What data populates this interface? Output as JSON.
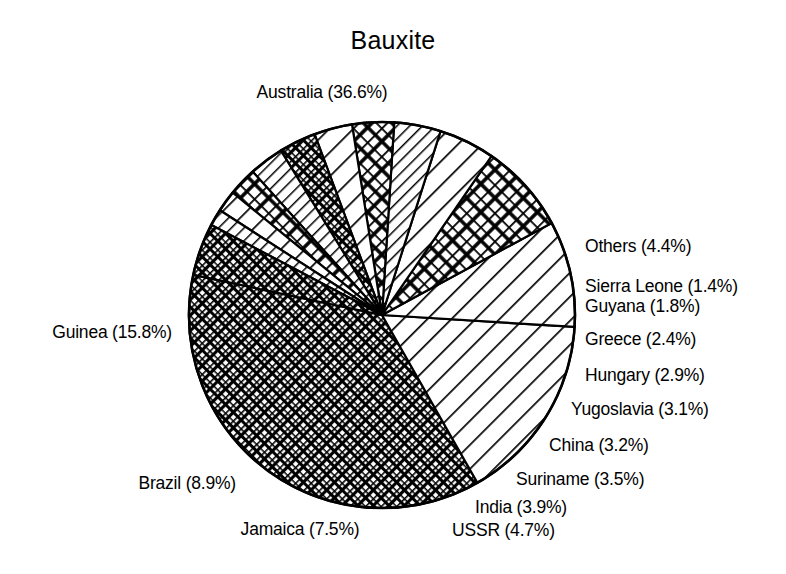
{
  "chart_data": {
    "type": "pie",
    "title": "Bauxite",
    "unit": "%",
    "total": 100.0,
    "start_angle_deg": -78,
    "direction": "clockwise",
    "grid": false,
    "legend": "none",
    "labels_inline": true,
    "categories": [
      "Australia",
      "Guinea",
      "Brazil",
      "Jamaica",
      "USSR",
      "India",
      "Suriname",
      "China",
      "Yugoslavia",
      "Hungary",
      "Greece",
      "Guyana",
      "Sierra Leone",
      "Others"
    ],
    "values": [
      36.6,
      15.8,
      8.9,
      7.5,
      4.7,
      3.9,
      3.5,
      3.2,
      3.1,
      2.9,
      2.4,
      1.8,
      1.4,
      4.4
    ],
    "slices": [
      {
        "name": "Australia",
        "value": 36.6,
        "label": "Australia (36.6%)",
        "pattern": "crosshatch-fine",
        "label_side": "top",
        "label_x": 322,
        "label_y": 96,
        "anchor": "middle"
      },
      {
        "name": "Guinea",
        "value": 15.8,
        "label": "Guinea (15.8%)",
        "pattern": "diagonal-wide",
        "label_side": "left",
        "label_x": 172,
        "label_y": 336,
        "anchor": "end"
      },
      {
        "name": "Brazil",
        "value": 8.9,
        "label": "Brazil (8.9%)",
        "pattern": "diagonal-wide",
        "label_side": "left",
        "label_x": 236,
        "label_y": 487,
        "anchor": "end"
      },
      {
        "name": "Jamaica",
        "value": 7.5,
        "label": "Jamaica (7.5%)",
        "pattern": "crosshatch-coarse",
        "label_side": "bottom",
        "label_x": 300,
        "label_y": 533,
        "anchor": "middle"
      },
      {
        "name": "USSR",
        "value": 4.7,
        "label": "USSR (4.7%)",
        "pattern": "diagonal-wide",
        "label_side": "bottom",
        "label_x": 452,
        "label_y": 534,
        "anchor": "start"
      },
      {
        "name": "India",
        "value": 3.9,
        "label": "India (3.9%)",
        "pattern": "diagonal-narrow",
        "label_side": "bottom",
        "label_x": 475,
        "label_y": 511,
        "anchor": "start"
      },
      {
        "name": "Suriname",
        "value": 3.5,
        "label": "Suriname (3.5%)",
        "pattern": "crosshatch-coarse",
        "label_side": "right",
        "label_x": 516,
        "label_y": 483,
        "anchor": "start"
      },
      {
        "name": "China",
        "value": 3.2,
        "label": "China (3.2%)",
        "pattern": "diagonal-wide",
        "label_side": "right",
        "label_x": 549,
        "label_y": 449,
        "anchor": "start"
      },
      {
        "name": "Yugoslavia",
        "value": 3.1,
        "label": "Yugoslavia (3.1%)",
        "pattern": "crosshatch-fine",
        "label_side": "right",
        "label_x": 571,
        "label_y": 413,
        "anchor": "start"
      },
      {
        "name": "Hungary",
        "value": 2.9,
        "label": "Hungary (2.9%)",
        "pattern": "diagonal-narrow",
        "label_side": "right",
        "label_x": 585,
        "label_y": 379,
        "anchor": "start"
      },
      {
        "name": "Greece",
        "value": 2.4,
        "label": "Greece (2.4%)",
        "pattern": "crosshatch-coarse",
        "label_side": "right",
        "label_x": 585,
        "label_y": 343,
        "anchor": "start"
      },
      {
        "name": "Guyana",
        "value": 1.8,
        "label": "Guyana (1.8%)",
        "pattern": "diagonal-wide",
        "label_side": "right",
        "label_x": 585,
        "label_y": 310,
        "anchor": "start"
      },
      {
        "name": "Sierra Leone",
        "value": 1.4,
        "label": "Sierra Leone (1.4%)",
        "pattern": "diagonal-narrow",
        "label_side": "right",
        "label_x": 585,
        "label_y": 290,
        "anchor": "start"
      },
      {
        "name": "Others",
        "value": 4.4,
        "label": "Others (4.4%)",
        "pattern": "crosshatch-fine",
        "label_side": "right",
        "label_x": 585,
        "label_y": 250,
        "anchor": "start"
      }
    ],
    "geometry": {
      "cx": 382,
      "cy": 315,
      "r": 193
    },
    "stroke_color": "#000000",
    "fill_color": "#ffffff"
  }
}
